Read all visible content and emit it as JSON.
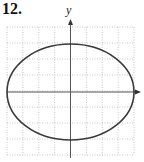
{
  "problem": {
    "number": "12."
  },
  "chart_data": {
    "type": "line",
    "title": "",
    "equation": "x^2/16 + y^2/9 = 1",
    "center": [
      0,
      0
    ],
    "semi_axis_x": 4,
    "semi_axis_y": 3,
    "xlabel": "",
    "ylabel": "y",
    "xlim": [
      -4,
      4
    ],
    "ylim": [
      -4,
      4
    ],
    "grid": true,
    "grid_style": "dotted",
    "tick_labels": false,
    "colors": {
      "curve": "#3a3a3a",
      "axis": "#555555",
      "grid": "#b0b0b0"
    }
  },
  "axes": {
    "y_label": "y"
  }
}
